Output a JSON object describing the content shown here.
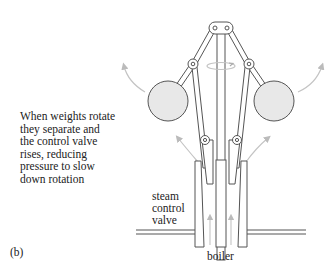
{
  "figure": {
    "label": "(b)",
    "caption_lines": [
      "When weights rotate",
      "they separate and",
      "the control valve",
      "rises, reducing",
      "pressure to slow",
      "down rotation"
    ],
    "labels": {
      "valve_lines": [
        "steam",
        "control",
        "valve"
      ],
      "boiler": "boiler"
    },
    "components": [
      "rotating-weight-left",
      "rotating-weight-right",
      "spindle",
      "linkage-arms",
      "rotation-arrow",
      "steam-control-valve",
      "steam-pipe",
      "boiler-flow-arrows",
      "outward-motion-arrows"
    ],
    "colors": {
      "line": "#555555",
      "weight_fill": "#e8e8e8",
      "arrow": "#bbbbbb",
      "text": "#222222"
    }
  }
}
